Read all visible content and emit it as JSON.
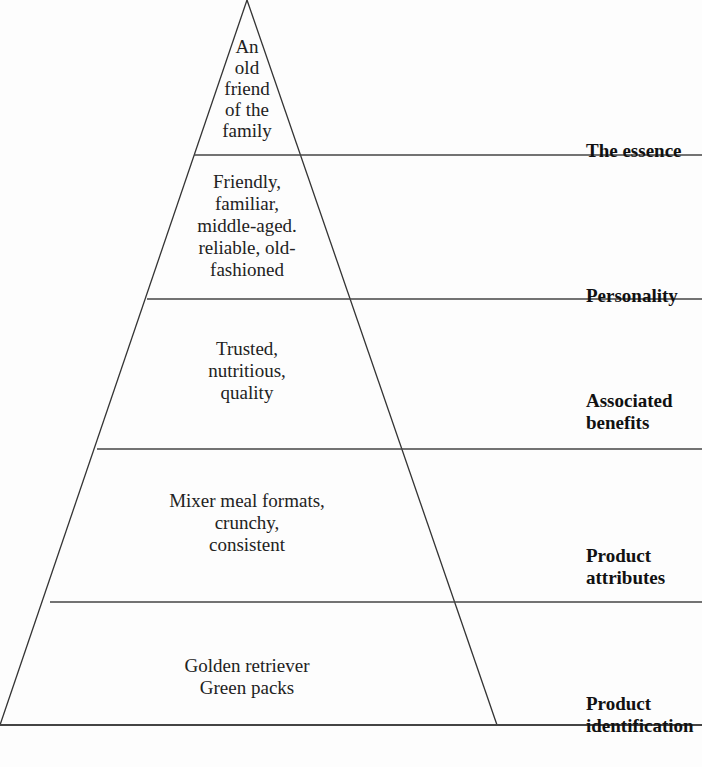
{
  "diagram": {
    "type": "brand-pyramid",
    "tiers": [
      {
        "level": "The essence",
        "content": "An\nold\nfriend\nof the\nfamily"
      },
      {
        "level": "Personality",
        "content": "Friendly,\nfamiliar,\nmiddle-aged.\nreliable, old-\nfashioned"
      },
      {
        "level": "Associated\nbenefits",
        "content": "Trusted,\nnutritious,\nquality"
      },
      {
        "level": "Product\nattributes",
        "content": "Mixer meal formats,\ncrunchy,\nconsistent"
      },
      {
        "level": "Product\nidentification",
        "content": "Golden retriever\nGreen packs"
      }
    ],
    "line_color": "#333333"
  }
}
